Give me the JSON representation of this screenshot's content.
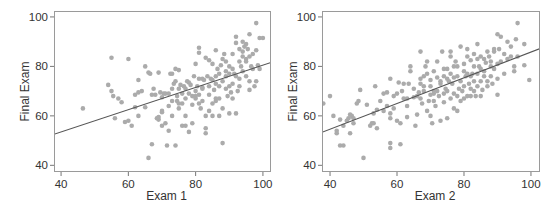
{
  "chart_data": [
    {
      "type": "scatter",
      "title": "",
      "xlabel": "Exam 1",
      "ylabel": "Final Exam",
      "xlim": [
        37.9,
        102.4
      ],
      "ylim": [
        37.3,
        102.4
      ],
      "xticks": [
        40,
        60,
        80,
        100
      ],
      "yticks": [
        40,
        60,
        80,
        100
      ],
      "grid": false,
      "legend": null,
      "fit_line": {
        "slope": 0.45,
        "intercept": 35.5
      },
      "frame_px": {
        "left": 54,
        "top": 11,
        "right": 271,
        "bottom": 172
      },
      "points": [
        [
          46.5,
          63
        ],
        [
          54,
          72.5
        ],
        [
          55,
          83.5
        ],
        [
          55,
          70
        ],
        [
          55.5,
          68
        ],
        [
          56,
          59
        ],
        [
          57,
          67
        ],
        [
          58,
          65.5
        ],
        [
          59,
          57.5
        ],
        [
          60,
          83
        ],
        [
          60,
          58
        ],
        [
          61,
          56
        ],
        [
          62,
          63.5
        ],
        [
          62,
          68.5
        ],
        [
          63,
          74.5
        ],
        [
          63,
          60
        ],
        [
          63,
          69.5
        ],
        [
          64,
          70
        ],
        [
          65,
          63.5
        ],
        [
          65,
          80
        ],
        [
          66,
          43
        ],
        [
          66,
          77.5
        ],
        [
          66.5,
          77
        ],
        [
          67,
          68.5
        ],
        [
          67,
          48.5
        ],
        [
          67.5,
          71
        ],
        [
          68,
          68.5
        ],
        [
          68.5,
          59
        ],
        [
          69,
          58.5
        ],
        [
          69,
          59.5
        ],
        [
          69,
          77.5
        ],
        [
          69.5,
          69.5
        ],
        [
          70,
          56
        ],
        [
          70,
          61.5
        ],
        [
          70,
          62
        ],
        [
          70,
          67.5
        ],
        [
          70.5,
          69
        ],
        [
          71,
          69
        ],
        [
          71,
          57
        ],
        [
          71.5,
          48
        ],
        [
          72,
          64
        ],
        [
          72,
          69
        ],
        [
          72,
          54
        ],
        [
          72.5,
          77
        ],
        [
          73,
          71
        ],
        [
          73,
          66
        ],
        [
          73,
          60
        ],
        [
          73,
          77
        ],
        [
          73.5,
          73
        ],
        [
          74,
          79
        ],
        [
          74,
          74
        ],
        [
          74,
          48
        ],
        [
          74.5,
          68
        ],
        [
          74.5,
          66
        ],
        [
          75,
          71
        ],
        [
          75,
          63
        ],
        [
          75,
          65
        ],
        [
          75,
          78.5
        ],
        [
          75.5,
          72.5
        ],
        [
          76,
          69
        ],
        [
          76,
          56
        ],
        [
          76,
          65
        ],
        [
          76.5,
          72
        ],
        [
          77,
          67
        ],
        [
          77,
          71
        ],
        [
          77,
          56
        ],
        [
          77,
          60
        ],
        [
          77.5,
          74
        ],
        [
          78,
          53.5
        ],
        [
          78,
          69
        ],
        [
          78,
          73.5
        ],
        [
          78.5,
          72.5
        ],
        [
          79,
          64.5
        ],
        [
          79,
          57
        ],
        [
          79,
          68
        ],
        [
          79.5,
          76
        ],
        [
          80,
          70
        ],
        [
          80,
          68
        ],
        [
          80,
          81
        ],
        [
          80,
          67
        ],
        [
          80.5,
          72
        ],
        [
          81,
          68.5
        ],
        [
          81,
          75
        ],
        [
          81,
          65
        ],
        [
          81,
          87.5
        ],
        [
          81,
          85.5
        ],
        [
          81.5,
          63
        ],
        [
          82,
          75
        ],
        [
          82,
          71
        ],
        [
          82,
          71.5
        ],
        [
          82,
          66
        ],
        [
          82.5,
          74.5
        ],
        [
          83,
          53
        ],
        [
          83,
          55
        ],
        [
          83,
          83.5
        ],
        [
          83,
          60
        ],
        [
          83.5,
          76
        ],
        [
          84,
          72
        ],
        [
          84,
          62
        ],
        [
          84,
          82.5
        ],
        [
          84,
          68.5
        ],
        [
          84.5,
          75
        ],
        [
          85,
          74.5
        ],
        [
          85,
          65
        ],
        [
          85,
          81
        ],
        [
          85,
          60
        ],
        [
          85.5,
          70.5
        ],
        [
          86,
          76
        ],
        [
          86,
          67
        ],
        [
          86,
          66
        ],
        [
          86,
          73
        ],
        [
          86,
          86.5
        ],
        [
          86.5,
          79
        ],
        [
          87,
          67
        ],
        [
          87,
          77
        ],
        [
          87,
          72
        ],
        [
          87,
          60
        ],
        [
          87.5,
          80.5
        ],
        [
          88,
          63
        ],
        [
          88,
          83
        ],
        [
          88,
          74
        ],
        [
          88,
          49
        ],
        [
          88.5,
          85
        ],
        [
          89,
          76
        ],
        [
          89,
          71
        ],
        [
          89,
          78
        ],
        [
          89,
          82
        ],
        [
          89.5,
          68
        ],
        [
          90,
          80
        ],
        [
          90,
          72
        ],
        [
          90,
          61
        ],
        [
          90,
          77
        ],
        [
          90.5,
          69.5
        ],
        [
          91,
          73
        ],
        [
          91,
          67
        ],
        [
          91,
          79
        ],
        [
          91,
          85
        ],
        [
          91.5,
          77
        ],
        [
          92,
          92
        ],
        [
          92,
          89.5
        ],
        [
          92,
          76
        ],
        [
          92,
          61
        ],
        [
          92.5,
          70
        ],
        [
          93,
          82
        ],
        [
          93,
          87
        ],
        [
          93,
          75
        ],
        [
          93,
          72
        ],
        [
          93.5,
          80
        ],
        [
          94,
          86
        ],
        [
          94,
          84
        ],
        [
          94,
          90
        ],
        [
          94,
          78
        ],
        [
          94.5,
          88
        ],
        [
          95,
          83
        ],
        [
          95,
          89
        ],
        [
          95,
          76
        ],
        [
          95,
          82
        ],
        [
          95.5,
          87
        ],
        [
          96,
          93
        ],
        [
          96,
          84
        ],
        [
          96,
          70.5
        ],
        [
          96,
          74
        ],
        [
          96.5,
          80
        ],
        [
          97,
          79
        ],
        [
          97,
          85
        ],
        [
          97.5,
          72
        ],
        [
          98,
          97.5
        ],
        [
          98,
          86.5
        ],
        [
          98,
          74
        ],
        [
          98.5,
          80.5
        ],
        [
          99,
          91.5
        ],
        [
          99,
          79
        ],
        [
          100,
          91.5
        ]
      ]
    },
    {
      "type": "scatter",
      "title": "",
      "xlabel": "Exam 2",
      "ylabel": "Final Exam",
      "xlim": [
        37.6,
        102.7
      ],
      "ylim": [
        37.3,
        102.4
      ],
      "xticks": [
        40,
        60,
        80,
        100
      ],
      "yticks": [
        40,
        60,
        80,
        100
      ],
      "grid": false,
      "legend": null,
      "fit_line": {
        "slope": 0.52,
        "intercept": 33.8
      },
      "frame_px": {
        "left": 322,
        "top": 11,
        "right": 540,
        "bottom": 172
      },
      "points": [
        [
          38,
          65
        ],
        [
          40,
          68
        ],
        [
          41,
          60
        ],
        [
          42,
          53
        ],
        [
          42,
          54
        ],
        [
          43,
          48
        ],
        [
          43,
          58.5
        ],
        [
          44,
          48
        ],
        [
          44,
          56
        ],
        [
          45,
          58
        ],
        [
          45.5,
          59
        ],
        [
          46,
          60.5
        ],
        [
          46,
          53
        ],
        [
          46.5,
          60
        ],
        [
          47,
          59
        ],
        [
          47,
          57
        ],
        [
          48,
          65
        ],
        [
          48.5,
          66
        ],
        [
          49,
          70.5
        ],
        [
          50,
          43
        ],
        [
          51,
          64.5
        ],
        [
          52,
          56
        ],
        [
          52.5,
          57
        ],
        [
          53,
          61
        ],
        [
          53,
          57
        ],
        [
          53.5,
          72
        ],
        [
          54,
          62.5
        ],
        [
          54,
          55
        ],
        [
          55,
          66
        ],
        [
          56,
          69
        ],
        [
          56,
          62
        ],
        [
          57,
          69.5
        ],
        [
          57,
          64
        ],
        [
          58,
          75
        ],
        [
          58,
          61
        ],
        [
          58,
          59
        ],
        [
          58,
          49
        ],
        [
          58,
          47
        ],
        [
          59,
          63
        ],
        [
          59,
          68
        ],
        [
          60,
          69
        ],
        [
          60,
          58
        ],
        [
          60.5,
          73.5
        ],
        [
          61,
          48.5
        ],
        [
          61,
          57
        ],
        [
          61.5,
          70
        ],
        [
          62,
          67
        ],
        [
          62,
          73
        ],
        [
          63,
          67
        ],
        [
          63,
          59.5
        ],
        [
          63,
          64
        ],
        [
          63.5,
          73
        ],
        [
          64,
          80
        ],
        [
          64,
          78
        ],
        [
          65,
          67.5
        ],
        [
          65,
          71
        ],
        [
          65.5,
          56
        ],
        [
          66,
          68
        ],
        [
          66,
          60.5
        ],
        [
          66.5,
          69.5
        ],
        [
          67,
          73
        ],
        [
          67,
          75
        ],
        [
          67,
          67
        ],
        [
          67,
          86
        ],
        [
          67.5,
          65
        ],
        [
          68,
          72
        ],
        [
          68,
          76
        ],
        [
          68,
          70
        ],
        [
          68.5,
          80
        ],
        [
          69,
          62
        ],
        [
          69,
          77
        ],
        [
          69,
          82
        ],
        [
          69.5,
          66
        ],
        [
          70,
          68.5
        ],
        [
          70,
          60
        ],
        [
          70,
          72
        ],
        [
          70,
          74.5
        ],
        [
          70.5,
          57
        ],
        [
          71,
          66
        ],
        [
          71,
          69
        ],
        [
          71,
          78
        ],
        [
          71,
          70
        ],
        [
          71.5,
          64
        ],
        [
          72,
          70
        ],
        [
          72,
          82
        ],
        [
          72,
          75.5
        ],
        [
          72.5,
          68
        ],
        [
          73,
          73
        ],
        [
          73,
          58
        ],
        [
          73,
          74
        ],
        [
          73.5,
          86
        ],
        [
          74,
          69
        ],
        [
          74,
          79
        ],
        [
          74,
          65.5
        ],
        [
          74,
          76
        ],
        [
          74.5,
          71
        ],
        [
          75,
          75
        ],
        [
          75,
          70
        ],
        [
          75,
          59
        ],
        [
          75,
          79
        ],
        [
          75.5,
          74
        ],
        [
          76,
          67
        ],
        [
          76,
          84
        ],
        [
          76,
          77
        ],
        [
          76,
          86
        ],
        [
          76.5,
          73
        ],
        [
          77,
          63
        ],
        [
          77,
          75.5
        ],
        [
          77,
          69
        ],
        [
          77,
          80
        ],
        [
          77.5,
          82
        ],
        [
          78,
          62
        ],
        [
          78,
          68
        ],
        [
          78,
          76
        ],
        [
          78,
          80
        ],
        [
          78.5,
          71
        ],
        [
          79,
          74
        ],
        [
          79,
          66
        ],
        [
          79,
          88
        ],
        [
          79.5,
          70
        ],
        [
          80,
          72
        ],
        [
          80,
          67
        ],
        [
          80,
          78
        ],
        [
          80,
          81
        ],
        [
          80.5,
          76
        ],
        [
          81,
          84
        ],
        [
          81,
          68
        ],
        [
          81,
          77
        ],
        [
          81,
          87
        ],
        [
          81.5,
          73
        ],
        [
          82,
          76
        ],
        [
          82,
          82.5
        ],
        [
          82,
          68
        ],
        [
          82,
          71
        ],
        [
          82.5,
          77
        ],
        [
          83,
          80
        ],
        [
          83,
          70
        ],
        [
          83,
          74
        ],
        [
          83,
          85
        ],
        [
          83.5,
          68
        ],
        [
          84,
          83
        ],
        [
          84,
          89
        ],
        [
          84,
          77
        ],
        [
          84,
          72
        ],
        [
          84.5,
          80
        ],
        [
          85,
          74
        ],
        [
          85,
          68
        ],
        [
          85,
          84
        ],
        [
          85,
          79
        ],
        [
          85.5,
          70.5
        ],
        [
          86,
          83
        ],
        [
          86,
          76
        ],
        [
          86,
          78
        ],
        [
          86.5,
          81.5
        ],
        [
          87,
          86
        ],
        [
          87,
          74
        ],
        [
          87,
          72
        ],
        [
          87.5,
          84
        ],
        [
          88,
          80
        ],
        [
          88,
          76
        ],
        [
          88,
          82
        ],
        [
          88.5,
          73
        ],
        [
          89,
          86
        ],
        [
          89,
          79
        ],
        [
          89,
          87
        ],
        [
          90,
          93
        ],
        [
          90,
          81
        ],
        [
          90,
          75
        ],
        [
          90,
          68.5
        ],
        [
          90.5,
          87
        ],
        [
          91,
          92
        ],
        [
          91,
          82
        ],
        [
          92,
          85
        ],
        [
          92,
          77
        ],
        [
          93,
          83
        ],
        [
          93,
          90
        ],
        [
          94,
          88
        ],
        [
          94,
          84
        ],
        [
          95,
          80
        ],
        [
          95,
          78
        ],
        [
          95.5,
          91
        ],
        [
          96,
          84
        ],
        [
          96,
          97.5
        ],
        [
          98,
          89
        ],
        [
          98,
          80.5
        ],
        [
          99.5,
          74.5
        ]
      ]
    }
  ]
}
